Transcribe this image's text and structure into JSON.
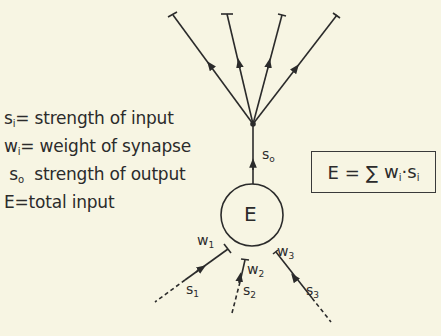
{
  "legend": {
    "items": [
      {
        "symbol": "s",
        "subscript": "i",
        "sep": "=",
        "text": "strength of input"
      },
      {
        "symbol": "w",
        "subscript": "i",
        "sep": "=",
        "text": "weight of synapse"
      },
      {
        "symbol": "s",
        "subscript": "o",
        "sep": "",
        "text": "strength of output"
      },
      {
        "symbol": "E",
        "subscript": "",
        "sep": "=",
        "text": "total input"
      }
    ]
  },
  "formula": {
    "lhs": "E",
    "eq": "=",
    "sum": "∑",
    "w": "w",
    "w_sub": "i",
    "dot": "·",
    "s": "s",
    "s_sub": "i"
  },
  "neuron": {
    "label": "E",
    "output_label": "s",
    "output_sub": "o"
  },
  "inputs": [
    {
      "signal": "s",
      "signal_sub": "1",
      "weight": "w",
      "weight_sub": "1"
    },
    {
      "signal": "s",
      "signal_sub": "2",
      "weight": "w",
      "weight_sub": "2"
    },
    {
      "signal": "s",
      "signal_sub": "3",
      "weight": "w",
      "weight_sub": "3"
    }
  ],
  "outputs": {
    "branch_count": 4
  },
  "colors": {
    "background": "#f7f5e3",
    "ink": "#2b2b2b"
  }
}
